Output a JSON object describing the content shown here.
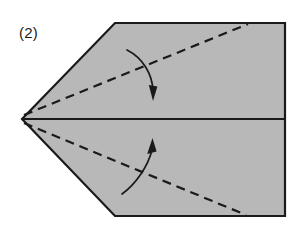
{
  "figure": {
    "step_label": "(2)",
    "background_color": "#ffffff",
    "paper_fill_color": "#b8b8b8",
    "outline_color": "#1a1a1a",
    "fold_line_color": "#1a1a1a",
    "arrow_color": "#1a1a1a"
  },
  "shape": {
    "name": "pentagon-paper",
    "description": "Pentagon shaped folded paper with left point",
    "points": "22,119 115,23 285,23 285,216 115,216",
    "vertices": [
      {
        "name": "left-apex",
        "x": 22,
        "y": 119
      },
      {
        "name": "top-left",
        "x": 115,
        "y": 23
      },
      {
        "name": "top-right",
        "x": 285,
        "y": 23
      },
      {
        "name": "bottom-right",
        "x": 285,
        "y": 216
      },
      {
        "name": "bottom-left",
        "x": 115,
        "y": 216
      }
    ]
  },
  "center_line": {
    "name": "horizontal-center-crease",
    "x1": 22,
    "y1": 119,
    "x2": 285,
    "y2": 119
  },
  "fold_lines": [
    {
      "name": "upper-fold-line",
      "style": "dashed",
      "x1": 24,
      "y1": 115,
      "x2": 248,
      "y2": 24,
      "dash": "9,6"
    },
    {
      "name": "lower-fold-line",
      "style": "dashed",
      "x1": 24,
      "y1": 123,
      "x2": 246,
      "y2": 215,
      "dash": "9,6"
    }
  ],
  "arrows": [
    {
      "name": "upper-fold-arrow",
      "direction": "down",
      "path": "M 127,50 C 143,58 152,74 153,90",
      "head_points": "153,101 148.5,86 157.5,86"
    },
    {
      "name": "lower-fold-arrow",
      "direction": "up",
      "path": "M 122,194 C 136,184 148,166 152,150",
      "head_points": "152,138 147,153 156.5,152"
    }
  ],
  "label_position": {
    "x": 19,
    "y": 38
  }
}
